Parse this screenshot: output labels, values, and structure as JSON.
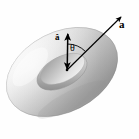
{
  "figure": {
    "background_color": "#fefefe",
    "stroke_color": "#000000",
    "torus": {
      "name": "torus",
      "fill_light": "#f2f2f2",
      "fill_mid": "#d8d8d8",
      "fill_dark": "#a8a8a8",
      "fill_shadow": "#8c8c8c",
      "outline_color": "#9a9a9a",
      "center_x": 62,
      "center_y": 72,
      "rotation_deg": -27,
      "outer_rx": 60,
      "outer_ry": 40,
      "tube_ratio": 0.42
    },
    "labels": {
      "vector_a": "a",
      "unit_normal": "â",
      "angle": "θ"
    },
    "arrows": [
      {
        "name": "vector-a-arrow",
        "label": "a",
        "x1": 67,
        "y1": 70,
        "x2": 124,
        "y2": 14,
        "double_headed": false,
        "line_width": 1.2
      },
      {
        "name": "unit-normal-arrow",
        "label": "â",
        "x1": 67,
        "y1": 71,
        "x2": 68,
        "y2": 31,
        "double_headed": true,
        "line_width": 1.4
      }
    ],
    "angle_arc": {
      "name": "theta-arc",
      "label": "θ",
      "vertex_x": 67,
      "vertex_y": 70,
      "radius": 26,
      "start_deg": -89,
      "end_deg": -45
    }
  }
}
